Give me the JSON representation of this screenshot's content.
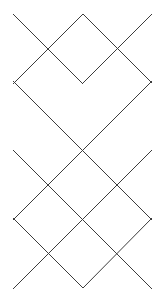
{
  "figure": {
    "type": "line-lattice",
    "width": 165,
    "height": 291,
    "background_color": "#ffffff",
    "line_color": "#3c3c3c",
    "line_width": 1
  },
  "geometry": {
    "description": "Argyle / diamond lattice formed by two families of parallel 45-degree diagonal lines",
    "slope_down_count": 5,
    "slope_up_count": 5,
    "left_edge_x": 13,
    "right_edge_x": 152,
    "top_vertex": {
      "x": 83,
      "y": 14
    },
    "bottom_vertex": {
      "x": 83,
      "y": 278
    },
    "left_vertices_y": [
      81,
      150,
      218
    ],
    "right_vertices_y": [
      81,
      150,
      218
    ],
    "diagonal_spacing": 69,
    "crossing_spacing": 34.5
  },
  "chart_data": {
    "type": "line",
    "xlabel": "",
    "ylabel": "",
    "xlim": [
      0,
      165
    ],
    "ylim": [
      0,
      291
    ],
    "grid": false,
    "legend": "none",
    "series": [
      {
        "name": "down-diagonal-1",
        "direction": "down-right",
        "x": [
          13,
          83
        ],
        "y": [
          14,
          84
        ]
      },
      {
        "name": "down-diagonal-2",
        "direction": "down-right",
        "x": [
          13,
          152
        ],
        "y": [
          81,
          220
        ]
      },
      {
        "name": "down-diagonal-3",
        "direction": "down-right",
        "x": [
          13,
          152
        ],
        "y": [
          150,
          289
        ]
      },
      {
        "name": "down-diagonal-4",
        "direction": "down-right",
        "x": [
          13,
          83
        ],
        "y": [
          218,
          288
        ]
      },
      {
        "name": "down-diagonal-5",
        "direction": "down-right",
        "x": [
          83,
          152
        ],
        "y": [
          14,
          83
        ]
      },
      {
        "name": "up-diagonal-1",
        "direction": "up-right",
        "x": [
          13,
          83
        ],
        "y": [
          84,
          14
        ]
      },
      {
        "name": "up-diagonal-2",
        "direction": "up-right",
        "x": [
          13,
          152
        ],
        "y": [
          220,
          81
        ]
      },
      {
        "name": "up-diagonal-3",
        "direction": "up-right",
        "x": [
          13,
          152
        ],
        "y": [
          289,
          150
        ]
      },
      {
        "name": "up-diagonal-4",
        "direction": "up-right",
        "x": [
          83,
          152
        ],
        "y": [
          288,
          218
        ]
      },
      {
        "name": "up-diagonal-5",
        "direction": "up-right",
        "x": [
          83,
          152
        ],
        "y": [
          83,
          14
        ]
      }
    ],
    "intersections": [
      {
        "x": 48,
        "y": 48
      },
      {
        "x": 118,
        "y": 48
      },
      {
        "x": 83,
        "y": 83
      },
      {
        "x": 48,
        "y": 117
      },
      {
        "x": 118,
        "y": 117
      },
      {
        "x": 83,
        "y": 152
      },
      {
        "x": 48,
        "y": 186
      },
      {
        "x": 118,
        "y": 186
      },
      {
        "x": 83,
        "y": 220
      },
      {
        "x": 48,
        "y": 254
      },
      {
        "x": 118,
        "y": 254
      }
    ]
  }
}
